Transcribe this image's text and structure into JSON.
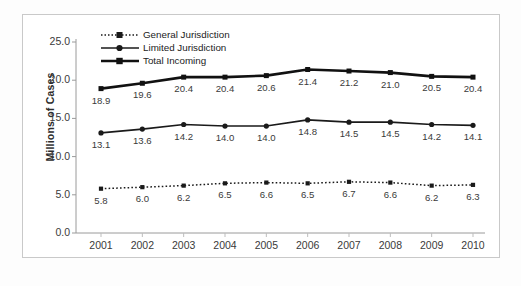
{
  "chart_data": {
    "type": "line",
    "title": "",
    "xlabel": "",
    "ylabel": "Millions of Cases",
    "categories": [
      "2001",
      "2002",
      "2003",
      "2004",
      "2005",
      "2006",
      "2007",
      "2008",
      "2009",
      "2010"
    ],
    "ylim": [
      0.0,
      25.0
    ],
    "yticks": [
      "0.0",
      "5.0",
      "10.0",
      "15.0",
      "20.0",
      "25.0"
    ],
    "ytick_values": [
      0.0,
      5.0,
      10.0,
      15.0,
      20.0,
      25.0
    ],
    "grid": false,
    "legend_position": "top-left inside",
    "series": [
      {
        "name": "General Jurisdiction",
        "marker": "square",
        "linestyle": "dotted",
        "color": "#1a1a1a",
        "values": [
          5.8,
          6.0,
          6.2,
          6.5,
          6.6,
          6.5,
          6.7,
          6.6,
          6.2,
          6.3
        ],
        "labels": [
          "5.8",
          "6.0",
          "6.2",
          "6.5",
          "6.6",
          "6.5",
          "6.7",
          "6.6",
          "6.2",
          "6.3"
        ]
      },
      {
        "name": "Limited Jurisdiction",
        "marker": "circle",
        "linestyle": "solid",
        "color": "#1a1a1a",
        "values": [
          13.1,
          13.6,
          14.2,
          14.0,
          14.0,
          14.8,
          14.5,
          14.5,
          14.2,
          14.1
        ],
        "labels": [
          "13.1",
          "13.6",
          "14.2",
          "14.0",
          "14.0",
          "14.8",
          "14.5",
          "14.5",
          "14.2",
          "14.1"
        ]
      },
      {
        "name": "Total Incoming",
        "marker": "square",
        "linestyle": "solid-thick",
        "color": "#111111",
        "values": [
          18.9,
          19.6,
          20.4,
          20.4,
          20.6,
          21.4,
          21.2,
          21.0,
          20.5,
          20.4
        ],
        "labels": [
          "18.9",
          "19.6",
          "20.4",
          "20.4",
          "20.6",
          "21.4",
          "21.2",
          "21.0",
          "20.5",
          "20.4"
        ]
      }
    ]
  }
}
